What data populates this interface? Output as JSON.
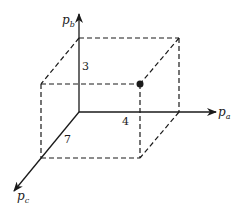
{
  "diagram": {
    "type": "3d-coordinate-box",
    "axes": [
      {
        "id": "pa",
        "label": "p",
        "subscript": "a",
        "direction": "right"
      },
      {
        "id": "pb",
        "label": "p",
        "subscript": "b",
        "direction": "up"
      },
      {
        "id": "pc",
        "label": "p",
        "subscript": "c",
        "direction": "down-left"
      }
    ],
    "dimension_labels": {
      "pb": "3",
      "pa": "4",
      "pc": "7"
    },
    "point": {
      "pa": 4,
      "pb": 3,
      "pc": 7
    },
    "colors": {
      "stroke": "#1a1a1a",
      "background": "#ffffff"
    }
  }
}
